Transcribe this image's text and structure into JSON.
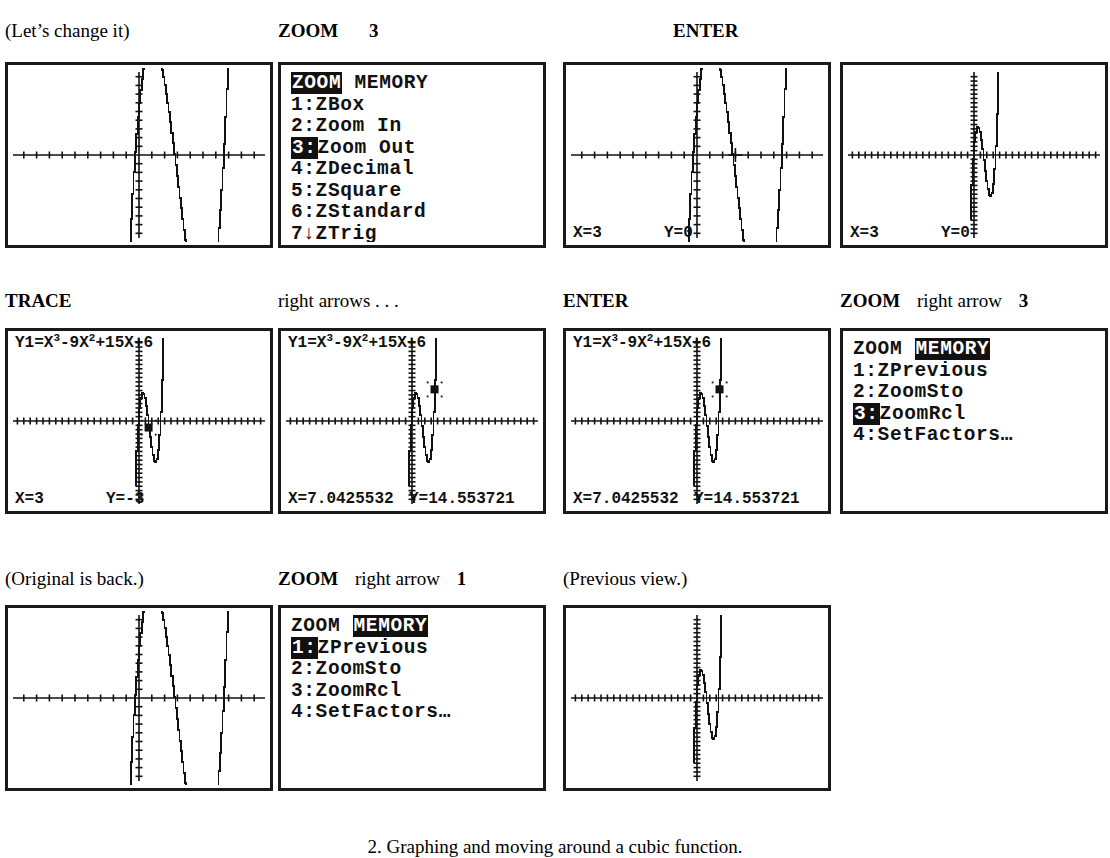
{
  "page": {
    "caption": "2. Graphing and moving around a cubic function.",
    "function_label": "Y1=X3-9X2+15X+6"
  },
  "rows": [
    {
      "id": "row-1",
      "headers": [
        {
          "text": "(Let’s change it)",
          "style": "serif"
        },
        {
          "text": "ZOOM",
          "style": "bold",
          "suffix": "3"
        },
        {
          "text": "",
          "style": "serif"
        },
        {
          "text": "ENTER",
          "style": "bold"
        }
      ],
      "screens": [
        {
          "kind": "graph",
          "name": "graph-original-standard",
          "xmin": -10,
          "xmax": 10,
          "ymin": -10,
          "ymax": 10,
          "xscl": 1,
          "yscl": 1,
          "status": {
            "left": "",
            "right": ""
          },
          "expr": "",
          "cursor": null
        },
        {
          "kind": "menu",
          "name": "zoom-menu-zoom-tab",
          "header": {
            "left": "ZOOM",
            "right": "MEMORY",
            "highlight": "left"
          },
          "items": [
            {
              "num": "1:",
              "label": "ZBox",
              "selected": false
            },
            {
              "num": "2:",
              "label": "Zoom In",
              "selected": false
            },
            {
              "num": "3:",
              "label": "Zoom Out",
              "selected": true
            },
            {
              "num": "4:",
              "label": "ZDecimal",
              "selected": false
            },
            {
              "num": "5:",
              "label": "ZSquare",
              "selected": false
            },
            {
              "num": "6:",
              "label": "ZStandard",
              "selected": false
            },
            {
              "num": "7↓",
              "label": "ZTrig",
              "selected": false
            }
          ]
        },
        {
          "kind": "graph",
          "name": "graph-zoom-out-cursor",
          "xmin": -10,
          "xmax": 10,
          "ymin": -10,
          "ymax": 10,
          "xscl": 1,
          "yscl": 1,
          "status": {
            "left": "X=3",
            "right": "Y=0"
          },
          "expr": "",
          "cursor": {
            "x": 3,
            "y": 0,
            "style": "crosshair"
          }
        },
        {
          "kind": "graph",
          "name": "graph-zoomed-out",
          "xmin": -40,
          "xmax": 40,
          "ymin": -40,
          "ymax": 40,
          "xscl": 1,
          "yscl": 1,
          "status": {
            "left": "X=3",
            "right": "Y=0"
          },
          "expr": "",
          "cursor": null
        }
      ]
    },
    {
      "id": "row-2",
      "headers": [
        {
          "text": "TRACE",
          "style": "bold"
        },
        {
          "text": "right arrows . . .",
          "style": "serif"
        },
        {
          "text": "ENTER",
          "style": "bold"
        },
        {
          "text": "ZOOM",
          "style": "bold",
          "mid": "right arrow",
          "suffix": "3"
        }
      ],
      "screens": [
        {
          "kind": "graph",
          "name": "graph-trace-start",
          "xmin": -40,
          "xmax": 40,
          "ymin": -40,
          "ymax": 40,
          "xscl": 1,
          "yscl": 1,
          "status": {
            "left": "X=3",
            "right": "Y=-3"
          },
          "expr": "Y1=X3-9X2+15X+6",
          "cursor": {
            "x": 3,
            "y": -3,
            "style": "block"
          }
        },
        {
          "kind": "graph",
          "name": "graph-trace-moved",
          "xmin": -40,
          "xmax": 40,
          "ymin": -40,
          "ymax": 40,
          "xscl": 1,
          "yscl": 1,
          "status": {
            "left": "X=7.0425532",
            "right": "Y=14.553721"
          },
          "expr": "Y1=X3-9X2+15X+6",
          "cursor": {
            "x": 7.0425532,
            "y": 14.553721,
            "style": "block"
          }
        },
        {
          "kind": "graph",
          "name": "graph-trace-entered",
          "xmin": -40,
          "xmax": 40,
          "ymin": -40,
          "ymax": 40,
          "xscl": 1,
          "yscl": 1,
          "status": {
            "left": "X=7.0425532",
            "right": "Y=14.553721"
          },
          "expr": "Y1=X3-9X2+15X+6",
          "cursor": {
            "x": 7.0425532,
            "y": 14.553721,
            "style": "block"
          }
        },
        {
          "kind": "menu",
          "name": "zoom-menu-memory-tab-zoomrcl",
          "header": {
            "left": "ZOOM",
            "right": "MEMORY",
            "highlight": "right"
          },
          "items": [
            {
              "num": "1:",
              "label": "ZPrevious",
              "selected": false
            },
            {
              "num": "2:",
              "label": "ZoomSto",
              "selected": false
            },
            {
              "num": "3:",
              "label": "ZoomRcl",
              "selected": true
            },
            {
              "num": "4:",
              "label": "SetFactors…",
              "selected": false
            }
          ]
        }
      ]
    },
    {
      "id": "row-3",
      "headers": [
        {
          "text": "(Original is back.)",
          "style": "serif"
        },
        {
          "text": "ZOOM",
          "style": "bold",
          "mid": "right arrow",
          "suffix": "1"
        },
        {
          "text": "(Previous view.)",
          "style": "serif"
        }
      ],
      "screens": [
        {
          "kind": "graph",
          "name": "graph-original-restored",
          "xmin": -10,
          "xmax": 10,
          "ymin": -10,
          "ymax": 10,
          "xscl": 1,
          "yscl": 1,
          "status": {
            "left": "",
            "right": ""
          },
          "expr": "",
          "cursor": null
        },
        {
          "kind": "menu",
          "name": "zoom-menu-memory-tab-zprevious",
          "header": {
            "left": "ZOOM",
            "right": "MEMORY",
            "highlight": "right"
          },
          "items": [
            {
              "num": "1:",
              "label": "ZPrevious",
              "selected": true
            },
            {
              "num": "2:",
              "label": "ZoomSto",
              "selected": false
            },
            {
              "num": "3:",
              "label": "ZoomRcl",
              "selected": false
            },
            {
              "num": "4:",
              "label": "SetFactors…",
              "selected": false
            }
          ]
        },
        {
          "kind": "graph",
          "name": "graph-previous-view",
          "xmin": -40,
          "xmax": 40,
          "ymin": -40,
          "ymax": 40,
          "xscl": 1,
          "yscl": 1,
          "status": {
            "left": "",
            "right": ""
          },
          "expr": "",
          "cursor": null
        }
      ]
    }
  ],
  "chart_data": {
    "type": "line",
    "title": "Y1=X3-9X2+15X+6",
    "expression": "y = x^3 - 9x^2 + 15x + 6",
    "coefficients": [
      1,
      -9,
      15,
      6
    ],
    "xlabel": "X",
    "ylabel": "Y",
    "views": [
      {
        "name": "standard",
        "xlim": [
          -10,
          10
        ],
        "ylim": [
          -10,
          10
        ],
        "xscl": 1,
        "yscl": 1
      },
      {
        "name": "zoomed-out",
        "xlim": [
          -40,
          40
        ],
        "ylim": [
          -40,
          40
        ],
        "xscl": 1,
        "yscl": 1
      }
    ],
    "trace_points": [
      {
        "x": 3,
        "y": 0
      },
      {
        "x": 3,
        "y": -3
      },
      {
        "x": 7.0425532,
        "y": 14.553721
      }
    ],
    "grid": false,
    "legend": "none"
  },
  "layout": {
    "screen_w": 268,
    "screen_h": 186,
    "rows_top": [
      62,
      328,
      605
    ],
    "hdr_top": [
      20,
      290,
      568
    ],
    "cols_x": [
      5,
      278,
      563,
      840
    ]
  }
}
